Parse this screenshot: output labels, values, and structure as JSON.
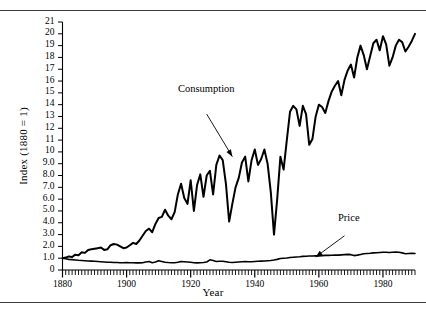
{
  "figure": {
    "rule_color": "#3a3a3a",
    "background": "#ffffff"
  },
  "chart_data": {
    "type": "line",
    "title": "",
    "xlabel": "Year",
    "ylabel": "Index (1880 = 1)",
    "xlim": [
      1880,
      1990
    ],
    "ylim": [
      0,
      21
    ],
    "grid": false,
    "legend_position": "inline-annotations",
    "xticks": [
      1880,
      1900,
      1920,
      1940,
      1960,
      1980
    ],
    "xtick_labels": [
      "1880",
      "1900",
      "1920",
      "1940",
      "1960",
      "1980"
    ],
    "minor_xtick_interval": 1,
    "yticks": [
      0,
      1,
      2,
      3,
      4,
      5,
      6,
      7,
      8,
      9,
      10,
      11,
      12,
      13,
      14,
      15,
      16,
      17,
      18,
      19,
      20,
      21
    ],
    "ytick_labels": [
      "0",
      "1.0",
      "2.0",
      "3.0",
      "4.0",
      "5.0",
      "6.0",
      "7.0",
      "8.0",
      "9.0",
      "10",
      "11",
      "12",
      "13",
      "14",
      "15",
      "16",
      "17",
      "18",
      "19",
      "20",
      "21"
    ],
    "annotations": [
      {
        "text": "Consumption",
        "x": 1925,
        "y": 13.2,
        "arrow_to_x": 1933,
        "arrow_to_y": 9.6
      },
      {
        "text": "Price",
        "x": 1968,
        "y": 2.9,
        "arrow_to_x": 1959,
        "arrow_to_y": 1.1
      }
    ],
    "series": [
      {
        "name": "Consumption",
        "line_width": 2.0,
        "color": "#000000",
        "x": [
          1880,
          1881,
          1882,
          1883,
          1884,
          1885,
          1886,
          1887,
          1888,
          1889,
          1890,
          1891,
          1892,
          1893,
          1894,
          1895,
          1896,
          1897,
          1898,
          1899,
          1900,
          1901,
          1902,
          1903,
          1904,
          1905,
          1906,
          1907,
          1908,
          1909,
          1910,
          1911,
          1912,
          1913,
          1914,
          1915,
          1916,
          1917,
          1918,
          1919,
          1920,
          1921,
          1922,
          1923,
          1924,
          1925,
          1926,
          1927,
          1928,
          1929,
          1930,
          1931,
          1932,
          1933,
          1934,
          1935,
          1936,
          1937,
          1938,
          1939,
          1940,
          1941,
          1942,
          1943,
          1944,
          1945,
          1946,
          1947,
          1948,
          1949,
          1950,
          1951,
          1952,
          1953,
          1954,
          1955,
          1956,
          1957,
          1958,
          1959,
          1960,
          1961,
          1962,
          1963,
          1964,
          1965,
          1966,
          1967,
          1968,
          1969,
          1970,
          1971,
          1972,
          1973,
          1974,
          1975,
          1976,
          1977,
          1978,
          1979,
          1980,
          1981,
          1982,
          1983,
          1984,
          1985,
          1986,
          1987,
          1988,
          1989,
          1990
        ],
        "values": [
          1.0,
          1.05,
          1.15,
          1.1,
          1.3,
          1.25,
          1.5,
          1.45,
          1.7,
          1.75,
          1.8,
          1.85,
          1.9,
          1.7,
          1.75,
          2.1,
          2.2,
          2.15,
          2.0,
          1.85,
          1.9,
          2.1,
          2.3,
          2.2,
          2.5,
          2.9,
          3.3,
          3.5,
          3.2,
          3.9,
          4.4,
          4.5,
          5.1,
          4.6,
          4.3,
          4.9,
          6.4,
          7.3,
          6.1,
          5.6,
          7.6,
          5.0,
          7.2,
          8.1,
          6.2,
          8.0,
          8.4,
          6.4,
          8.9,
          9.7,
          9.3,
          7.3,
          4.1,
          5.6,
          7.0,
          7.8,
          9.1,
          9.6,
          7.5,
          9.3,
          10.2,
          8.9,
          9.4,
          10.2,
          9.0,
          6.6,
          3.0,
          6.0,
          9.6,
          8.5,
          11.0,
          13.4,
          13.9,
          13.6,
          12.2,
          13.9,
          13.2,
          10.6,
          11.1,
          13.0,
          14.0,
          13.8,
          13.3,
          14.3,
          15.1,
          15.6,
          16.0,
          14.8,
          16.1,
          16.9,
          17.4,
          16.3,
          18.0,
          19.0,
          18.2,
          17.0,
          18.1,
          19.2,
          19.5,
          18.6,
          19.8,
          19.1,
          17.3,
          18.0,
          19.0,
          19.5,
          19.3,
          18.5,
          18.9,
          19.4,
          20.0
        ]
      },
      {
        "name": "Price",
        "line_width": 1.6,
        "color": "#000000",
        "x": [
          1880,
          1881,
          1882,
          1883,
          1884,
          1885,
          1886,
          1887,
          1888,
          1889,
          1890,
          1891,
          1892,
          1893,
          1894,
          1895,
          1896,
          1897,
          1898,
          1899,
          1900,
          1901,
          1902,
          1903,
          1904,
          1905,
          1906,
          1907,
          1908,
          1909,
          1910,
          1911,
          1912,
          1913,
          1914,
          1915,
          1916,
          1917,
          1918,
          1919,
          1920,
          1921,
          1922,
          1923,
          1924,
          1925,
          1926,
          1927,
          1928,
          1929,
          1930,
          1931,
          1932,
          1933,
          1934,
          1935,
          1936,
          1937,
          1938,
          1939,
          1940,
          1941,
          1942,
          1943,
          1944,
          1945,
          1946,
          1947,
          1948,
          1949,
          1950,
          1951,
          1952,
          1953,
          1954,
          1955,
          1956,
          1957,
          1958,
          1959,
          1960,
          1961,
          1962,
          1963,
          1964,
          1965,
          1966,
          1967,
          1968,
          1969,
          1970,
          1971,
          1972,
          1973,
          1974,
          1975,
          1976,
          1977,
          1978,
          1979,
          1980,
          1981,
          1982,
          1983,
          1984,
          1985,
          1986,
          1987,
          1988,
          1989,
          1990
        ],
        "values": [
          1.0,
          0.95,
          0.9,
          0.88,
          0.85,
          0.82,
          0.8,
          0.78,
          0.76,
          0.75,
          0.74,
          0.72,
          0.7,
          0.68,
          0.66,
          0.65,
          0.64,
          0.63,
          0.62,
          0.62,
          0.63,
          0.62,
          0.61,
          0.6,
          0.6,
          0.62,
          0.68,
          0.72,
          0.62,
          0.68,
          0.78,
          0.72,
          0.66,
          0.63,
          0.62,
          0.62,
          0.66,
          0.72,
          0.7,
          0.68,
          0.65,
          0.62,
          0.6,
          0.62,
          0.63,
          0.68,
          0.86,
          0.8,
          0.72,
          0.74,
          0.74,
          0.7,
          0.66,
          0.64,
          0.66,
          0.68,
          0.7,
          0.72,
          0.7,
          0.7,
          0.72,
          0.74,
          0.75,
          0.76,
          0.78,
          0.8,
          0.84,
          0.9,
          0.98,
          1.0,
          1.02,
          1.06,
          1.08,
          1.1,
          1.12,
          1.15,
          1.16,
          1.18,
          1.18,
          1.2,
          1.2,
          1.22,
          1.24,
          1.24,
          1.25,
          1.26,
          1.26,
          1.28,
          1.3,
          1.32,
          1.3,
          1.22,
          1.26,
          1.32,
          1.38,
          1.4,
          1.42,
          1.45,
          1.46,
          1.48,
          1.5,
          1.5,
          1.48,
          1.5,
          1.52,
          1.5,
          1.45,
          1.38,
          1.4,
          1.42,
          1.4
        ]
      }
    ]
  }
}
